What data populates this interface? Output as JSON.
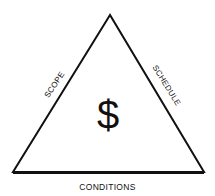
{
  "diagram": {
    "type": "triangle",
    "center_symbol": "$",
    "sides": {
      "left": "SCOPE",
      "right": "SCHEDULE",
      "bottom": "CONDITIONS"
    },
    "colors": {
      "stroke": "#111111",
      "background": "#ffffff"
    }
  }
}
